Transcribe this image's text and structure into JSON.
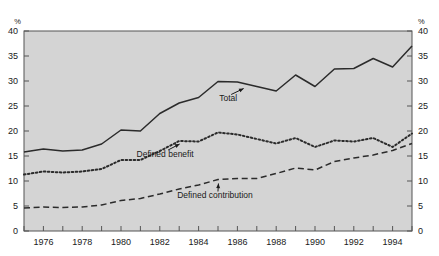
{
  "chart_data": {
    "type": "line",
    "title": "",
    "xlabel": "",
    "ylabel": "%",
    "ylabel_right": "%",
    "ylim": [
      0,
      40
    ],
    "yticks": [
      0,
      5,
      10,
      15,
      20,
      25,
      30,
      35,
      40
    ],
    "xlim": [
      1975,
      1995
    ],
    "x": [
      1975,
      1976,
      1977,
      1978,
      1979,
      1980,
      1981,
      1982,
      1983,
      1984,
      1985,
      1986,
      1987,
      1988,
      1989,
      1990,
      1991,
      1992,
      1993,
      1994,
      1995
    ],
    "xticks": [
      1975,
      1976,
      1977,
      1978,
      1979,
      1980,
      1981,
      1982,
      1983,
      1984,
      1985,
      1986,
      1987,
      1988,
      1989,
      1990,
      1991,
      1992,
      1993,
      1994,
      1995
    ],
    "xtick_labels": [
      "",
      "1976",
      "",
      "1978",
      "",
      "1980",
      "",
      "1982",
      "",
      "1984",
      "",
      "1986",
      "",
      "1988",
      "",
      "1990",
      "",
      "1992",
      "",
      "1994",
      ""
    ],
    "grid": false,
    "legend_position": "inline-annotations",
    "series": [
      {
        "name": "Total",
        "style": "solid",
        "color": "#2b2b2b",
        "values": [
          15.8,
          16.4,
          16.0,
          16.2,
          17.4,
          20.2,
          20.0,
          23.5,
          25.6,
          26.7,
          29.9,
          29.8,
          28.9,
          28.0,
          31.2,
          28.9,
          32.4,
          32.5,
          34.5,
          32.8,
          37.0
        ]
      },
      {
        "name": "Defined benefit",
        "style": "dotted",
        "color": "#2b2b2b",
        "values": [
          11.3,
          11.9,
          11.7,
          11.9,
          12.4,
          14.2,
          14.2,
          16.0,
          18.0,
          17.9,
          19.7,
          19.3,
          18.4,
          17.5,
          18.6,
          16.8,
          18.1,
          17.9,
          18.6,
          16.8,
          19.5
        ]
      },
      {
        "name": "Defined contribution",
        "style": "dashed",
        "color": "#2b2b2b",
        "values": [
          4.6,
          4.8,
          4.7,
          4.8,
          5.2,
          6.1,
          6.5,
          7.4,
          8.4,
          9.2,
          10.3,
          10.5,
          10.5,
          11.5,
          12.6,
          12.2,
          13.9,
          14.6,
          15.2,
          16.1,
          17.5
        ]
      }
    ],
    "annotations": [
      {
        "text": "Total",
        "target_year": 1986.4,
        "target_value": 29.4
      },
      {
        "text": "Defined benefit",
        "target_year": 1983.1,
        "target_value": 18.3
      },
      {
        "text": "Defined contribution",
        "target_year": 1985.1,
        "target_value": 10.4
      }
    ],
    "colors": {
      "plot_background": "#d4d4d4",
      "page_background": "#ffffff",
      "axis": "#555555",
      "line": "#2b2b2b",
      "text": "#1a1a1a"
    }
  }
}
